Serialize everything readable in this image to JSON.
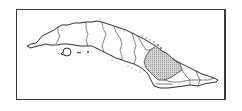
{
  "map": {
    "subject": "Cuba",
    "type": "locator-map",
    "highlighted_region": {
      "name": "Camagüey province (highlighted)",
      "fill": "#c8c8c8",
      "pattern": "stipple"
    },
    "colors": {
      "background": "#ffffff",
      "outline": "#1a1a1a",
      "frame": "#3a3a3a",
      "highlight": "#c8c8c8"
    }
  }
}
